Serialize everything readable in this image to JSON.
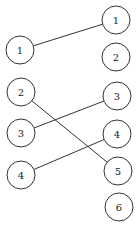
{
  "diagram": {
    "type": "bipartite-matching",
    "left_nodes": [
      {
        "id": "L1",
        "label": "1",
        "cx": 20,
        "cy": 50
      },
      {
        "id": "L2",
        "label": "2",
        "cx": 21,
        "cy": 92
      },
      {
        "id": "L3",
        "label": "3",
        "cx": 21,
        "cy": 133
      },
      {
        "id": "L4",
        "label": "4",
        "cx": 21,
        "cy": 175
      }
    ],
    "right_nodes": [
      {
        "id": "R1",
        "label": "1",
        "cx": 116,
        "cy": 20
      },
      {
        "id": "R2",
        "label": "2",
        "cx": 116,
        "cy": 57
      },
      {
        "id": "R3",
        "label": "3",
        "cx": 117,
        "cy": 96
      },
      {
        "id": "R4",
        "label": "4",
        "cx": 117,
        "cy": 134
      },
      {
        "id": "R5",
        "label": "5",
        "cx": 118,
        "cy": 171
      },
      {
        "id": "R6",
        "label": "6",
        "cx": 119,
        "cy": 207
      }
    ],
    "edges": [
      {
        "from": "L1",
        "to": "R1"
      },
      {
        "from": "L2",
        "to": "R5"
      },
      {
        "from": "L3",
        "to": "R3"
      },
      {
        "from": "L4",
        "to": "R4"
      }
    ],
    "radius": 14
  }
}
